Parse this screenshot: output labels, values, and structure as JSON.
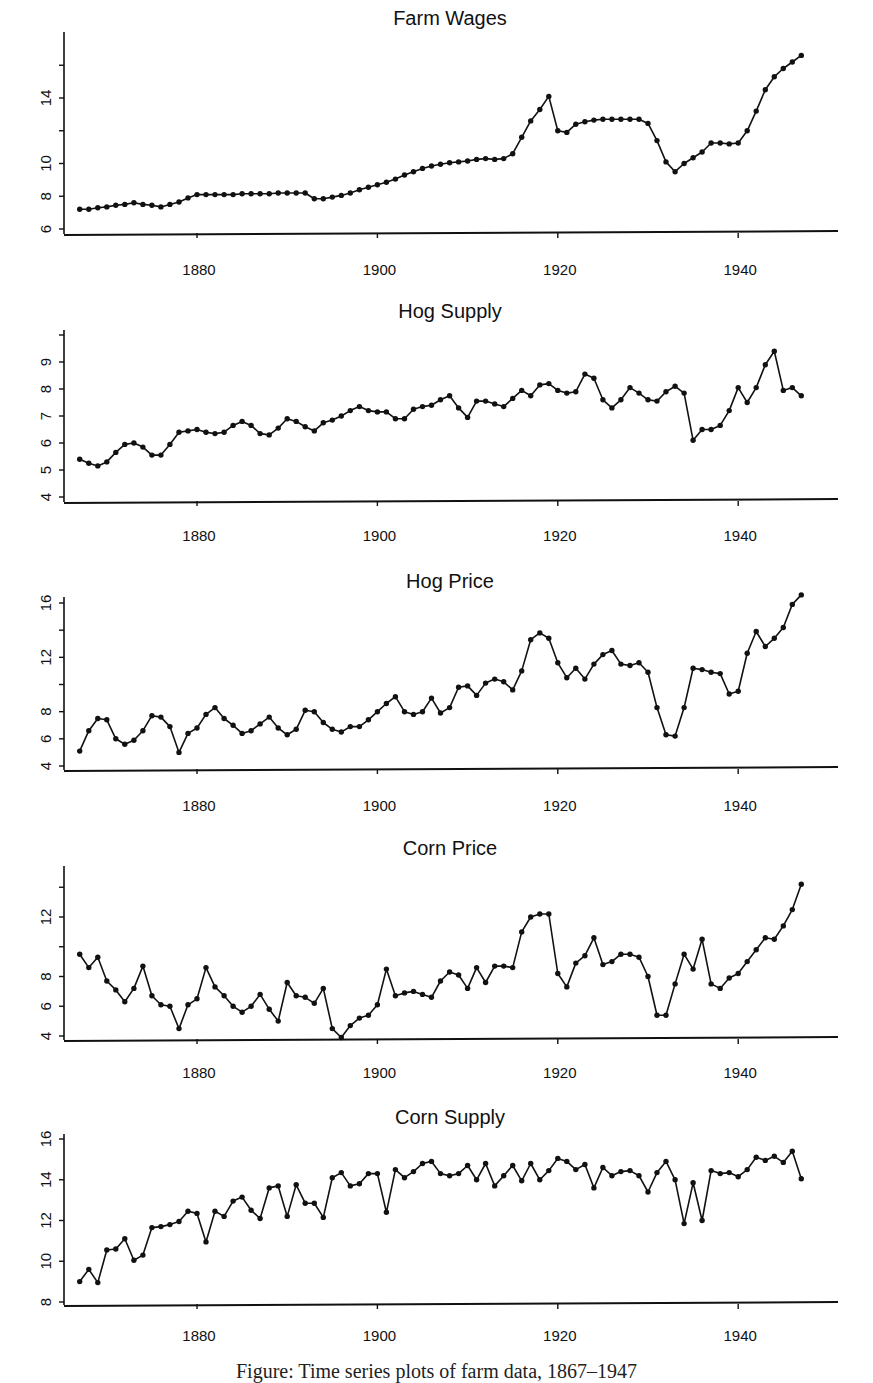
{
  "figure": {
    "caption": "Figure: Time series plots of farm data, 1867–1947"
  },
  "chart_data": [
    {
      "type": "line",
      "title": "Farm Wages",
      "xlabel": "",
      "ylabel": "",
      "x_start": 1867,
      "x_end": 1947,
      "xticks": [
        1880,
        1900,
        1920,
        1940
      ],
      "yticks": [
        6,
        8,
        10,
        14
      ],
      "ylim": [
        5.8,
        16.8
      ],
      "grid": false,
      "values": [
        7.2,
        7.2,
        7.3,
        7.35,
        7.45,
        7.5,
        7.6,
        7.5,
        7.45,
        7.35,
        7.5,
        7.65,
        7.9,
        8.1,
        8.1,
        8.1,
        8.1,
        8.1,
        8.15,
        8.15,
        8.15,
        8.15,
        8.2,
        8.2,
        8.2,
        8.2,
        7.85,
        7.85,
        7.95,
        8.05,
        8.2,
        8.4,
        8.55,
        8.7,
        8.85,
        9.05,
        9.3,
        9.5,
        9.7,
        9.85,
        9.95,
        10.05,
        10.1,
        10.15,
        10.25,
        10.3,
        10.25,
        10.3,
        10.6,
        11.6,
        12.6,
        13.3,
        14.1,
        12.0,
        11.9,
        12.4,
        12.55,
        12.65,
        12.7,
        12.7,
        12.7,
        12.7,
        12.7,
        12.45,
        11.4,
        10.1,
        9.5,
        10.0,
        10.35,
        10.7,
        11.25,
        11.25,
        11.2,
        11.25,
        12.0,
        13.2,
        14.5,
        15.3,
        15.8,
        16.2,
        16.6
      ]
    },
    {
      "type": "line",
      "title": "Hog Supply",
      "xlabel": "",
      "ylabel": "",
      "x_start": 1867,
      "x_end": 1947,
      "xticks": [
        1880,
        1900,
        1920,
        1940
      ],
      "yticks": [
        4,
        5,
        6,
        7,
        8,
        9
      ],
      "ylim": [
        3.95,
        10.1
      ],
      "grid": false,
      "values": [
        5.4,
        5.25,
        5.15,
        5.3,
        5.65,
        5.95,
        6.0,
        5.85,
        5.55,
        5.55,
        5.95,
        6.4,
        6.45,
        6.5,
        6.4,
        6.35,
        6.4,
        6.65,
        6.8,
        6.65,
        6.35,
        6.3,
        6.55,
        6.9,
        6.8,
        6.6,
        6.45,
        6.75,
        6.85,
        7.0,
        7.2,
        7.35,
        7.2,
        7.15,
        7.15,
        6.9,
        6.9,
        7.25,
        7.35,
        7.4,
        7.6,
        7.75,
        7.3,
        6.95,
        7.55,
        7.55,
        7.45,
        7.35,
        7.65,
        7.95,
        7.75,
        8.15,
        8.2,
        7.95,
        7.85,
        7.9,
        8.55,
        8.4,
        7.6,
        7.3,
        7.6,
        8.05,
        7.85,
        7.6,
        7.55,
        7.9,
        8.1,
        7.85,
        6.1,
        6.5,
        6.5,
        6.65,
        7.2,
        8.05,
        7.5,
        8.05,
        8.9,
        9.4,
        7.95,
        8.05,
        7.75
      ]
    },
    {
      "type": "line",
      "title": "Hog Price",
      "xlabel": "",
      "ylabel": "",
      "x_start": 1867,
      "x_end": 1947,
      "xticks": [
        1880,
        1900,
        1920,
        1940
      ],
      "yticks": [
        4,
        6,
        8,
        12,
        16
      ],
      "ylim": [
        3.9,
        16.8
      ],
      "grid": false,
      "values": [
        5.1,
        6.6,
        7.5,
        7.4,
        6.0,
        5.6,
        5.9,
        6.6,
        7.7,
        7.6,
        6.9,
        5.0,
        6.4,
        6.8,
        7.8,
        8.3,
        7.5,
        7.0,
        6.4,
        6.6,
        7.1,
        7.6,
        6.8,
        6.3,
        6.7,
        8.1,
        8.0,
        7.2,
        6.7,
        6.5,
        6.9,
        6.9,
        7.4,
        8.0,
        8.6,
        9.1,
        8.0,
        7.8,
        8.0,
        9.0,
        7.9,
        8.3,
        9.8,
        9.9,
        9.2,
        10.1,
        10.4,
        10.2,
        9.6,
        11.0,
        13.3,
        13.8,
        13.4,
        11.6,
        10.5,
        11.2,
        10.4,
        11.5,
        12.2,
        12.5,
        11.5,
        11.4,
        11.6,
        10.9,
        8.3,
        6.3,
        6.2,
        8.3,
        11.2,
        11.1,
        10.9,
        10.8,
        9.3,
        9.5,
        12.3,
        13.9,
        12.8,
        13.4,
        14.2,
        15.9,
        16.6
      ]
    },
    {
      "type": "line",
      "title": "Corn Price",
      "xlabel": "",
      "ylabel": "",
      "x_start": 1867,
      "x_end": 1947,
      "xticks": [
        1880,
        1900,
        1920,
        1940
      ],
      "yticks": [
        4,
        6,
        8,
        12
      ],
      "ylim": [
        3.9,
        15.3
      ],
      "grid": false,
      "values": [
        9.5,
        8.6,
        9.3,
        7.7,
        7.1,
        6.3,
        7.2,
        8.7,
        6.7,
        6.1,
        6.0,
        4.5,
        6.1,
        6.5,
        8.6,
        7.3,
        6.7,
        6.0,
        5.6,
        6.0,
        6.8,
        5.8,
        5.0,
        7.6,
        6.7,
        6.6,
        6.2,
        7.2,
        4.5,
        3.9,
        4.7,
        5.2,
        5.4,
        6.1,
        8.5,
        6.7,
        6.9,
        7.0,
        6.8,
        6.6,
        7.7,
        8.3,
        8.1,
        7.2,
        8.6,
        7.6,
        8.7,
        8.7,
        8.6,
        11.0,
        12.0,
        12.2,
        12.2,
        8.2,
        7.3,
        8.9,
        9.4,
        10.6,
        8.8,
        9.0,
        9.5,
        9.5,
        9.3,
        8.0,
        5.4,
        5.4,
        7.5,
        9.5,
        8.5,
        10.5,
        7.5,
        7.2,
        7.9,
        8.2,
        9.0,
        9.8,
        10.6,
        10.5,
        11.4,
        12.5,
        14.2
      ]
    },
    {
      "type": "line",
      "title": "Corn Supply",
      "xlabel": "",
      "ylabel": "",
      "x_start": 1867,
      "x_end": 1947,
      "xticks": [
        1880,
        1900,
        1920,
        1940
      ],
      "yticks": [
        8,
        10,
        12,
        14,
        16
      ],
      "ylim": [
        7.85,
        16.2
      ],
      "grid": false,
      "values": [
        9.0,
        9.6,
        8.95,
        10.55,
        10.6,
        11.1,
        10.05,
        10.3,
        11.65,
        11.7,
        11.8,
        11.95,
        12.45,
        12.35,
        10.95,
        12.45,
        12.2,
        12.95,
        13.15,
        12.5,
        12.1,
        13.6,
        13.7,
        12.2,
        13.75,
        12.85,
        12.85,
        12.15,
        14.1,
        14.35,
        13.7,
        13.8,
        14.3,
        14.3,
        12.4,
        14.5,
        14.1,
        14.4,
        14.8,
        14.9,
        14.3,
        14.2,
        14.3,
        14.7,
        14.0,
        14.8,
        13.7,
        14.2,
        14.7,
        13.95,
        14.8,
        14.0,
        14.45,
        15.05,
        14.9,
        14.5,
        14.75,
        13.6,
        14.6,
        14.2,
        14.4,
        14.45,
        14.2,
        13.4,
        14.35,
        14.9,
        14.0,
        11.85,
        13.85,
        12.0,
        14.45,
        14.3,
        14.35,
        14.15,
        14.5,
        15.1,
        14.95,
        15.15,
        14.85,
        15.4,
        14.05
      ]
    }
  ]
}
